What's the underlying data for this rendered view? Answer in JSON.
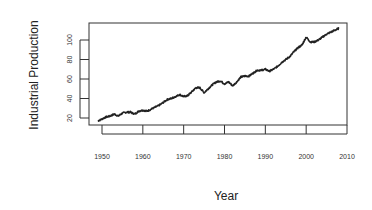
{
  "chart_data": {
    "type": "line",
    "title": "",
    "xlabel": "Year",
    "ylabel": "Industrial Production",
    "xlim": [
      1947,
      2012
    ],
    "ylim": [
      13,
      117
    ],
    "xticks": [
      1950,
      1960,
      1970,
      1980,
      1990,
      2000,
      2010
    ],
    "yticks": [
      20,
      40,
      60,
      80,
      100
    ],
    "grid": false,
    "legend": null,
    "series": [
      {
        "name": "Industrial Production",
        "color": "#222222",
        "x": [
          1949,
          1950,
          1951,
          1952,
          1953,
          1954,
          1955,
          1956,
          1957,
          1958,
          1959,
          1960,
          1961,
          1962,
          1963,
          1964,
          1965,
          1966,
          1967,
          1968,
          1969,
          1970,
          1971,
          1972,
          1973,
          1974,
          1975,
          1976,
          1977,
          1978,
          1979,
          1980,
          1981,
          1982,
          1983,
          1984,
          1985,
          1986,
          1987,
          1988,
          1989,
          1990,
          1991,
          1992,
          1993,
          1994,
          1995,
          1996,
          1997,
          1998,
          1999,
          2000,
          2001,
          2002,
          2003,
          2004,
          2005,
          2006,
          2007,
          2008
        ],
        "values": [
          17,
          19,
          21,
          22,
          24,
          22,
          25,
          26,
          26,
          24,
          27,
          28,
          27,
          29,
          31,
          33,
          36,
          39,
          40,
          42,
          44,
          42,
          43,
          47,
          51,
          51,
          46,
          50,
          54,
          57,
          58,
          55,
          57,
          53,
          57,
          62,
          63,
          63,
          66,
          69,
          69,
          70,
          68,
          70,
          73,
          77,
          80,
          83,
          88,
          92,
          95,
          103,
          98,
          98,
          100,
          103,
          106,
          108,
          110,
          112
        ]
      }
    ]
  }
}
